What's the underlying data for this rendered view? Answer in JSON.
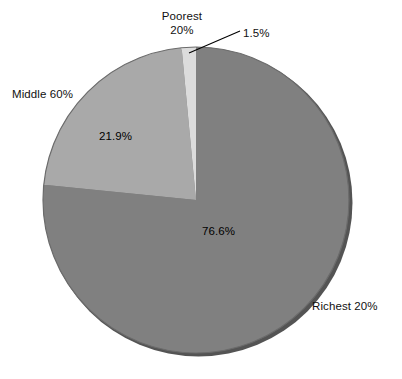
{
  "chart_data": {
    "type": "pie",
    "title": "",
    "subtitle": "",
    "xlabel": "",
    "ylabel": "",
    "legend_position": "none",
    "grid": false,
    "categories": [
      "Poorest 20%",
      "Middle 60%",
      "Richest 20%"
    ],
    "values": [
      1.5,
      21.9,
      76.6
    ],
    "value_labels": [
      "1.5%",
      "21.9%",
      "76.6%"
    ],
    "units": "percent",
    "slices": [
      {
        "name": "Poorest 20%",
        "category_label": "Poorest 20%",
        "category_label_line1": "Poorest",
        "category_label_line2": "20%",
        "value": 1.5,
        "value_label": "1.5%",
        "color": "#dcdcdc",
        "start_angle_deg": 354.6,
        "end_angle_deg": 0.0,
        "label_placement": "outside-with-leader",
        "leader_line": true
      },
      {
        "name": "Richest 20%",
        "category_label": "Richest 20%",
        "value": 76.6,
        "value_label": "76.6%",
        "color": "#808080",
        "start_angle_deg": 0.0,
        "end_angle_deg": 275.8,
        "label_placement": "outside",
        "leader_line": false
      },
      {
        "name": "Middle 60%",
        "category_label": "Middle 60%",
        "value": 21.9,
        "value_label": "21.9%",
        "color": "#a9a9a9",
        "start_angle_deg": 275.8,
        "end_angle_deg": 354.6,
        "label_placement": "outside",
        "leader_line": false
      }
    ],
    "total": 100.0,
    "background_color": "#ffffff",
    "outline_color": "#4a4a4a",
    "text_color": "#000000",
    "style": "3d-shadow-edge"
  },
  "labels": {
    "poorest_line1": "Poorest",
    "poorest_line2": "20%",
    "poorest_callout": "1.5%",
    "middle": "Middle 60%",
    "richest": "Richest 20%",
    "value_middle": "21.9%",
    "value_richest": "76.6%"
  },
  "geometry": {
    "center_x": 196,
    "center_y": 200,
    "radius_x": 153,
    "radius_y": 153
  }
}
